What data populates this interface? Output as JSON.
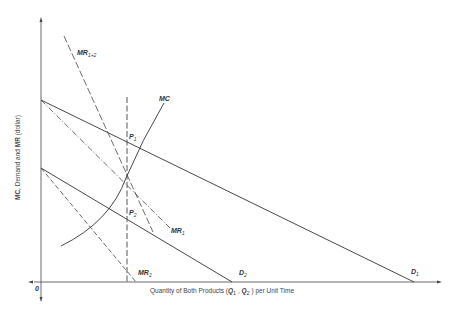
{
  "diagram": {
    "title": "",
    "axes": {
      "y_label_parts": {
        "mc": "MC",
        "mid": ", Demand and ",
        "mr": "MR",
        "end": " (dollar)"
      },
      "x_label_parts": {
        "pre": "Quantity of Both Products (",
        "q1": "Q",
        "q1sub": "1",
        "sep": " , ",
        "q2": "Q",
        "q2sub": "2",
        "post": " ) per Unit Time"
      },
      "origin": "0"
    },
    "curves": {
      "mr12": {
        "main": "MR",
        "sub": "1+2"
      },
      "mc": {
        "main": "MC"
      },
      "p1": {
        "main": "P",
        "sub": "1"
      },
      "p2": {
        "main": "P",
        "sub": "2"
      },
      "mr1": {
        "main": "MR",
        "sub": "1"
      },
      "mr2": {
        "main": "MR",
        "sub": "2"
      },
      "d1": {
        "main": "D",
        "sub": "1"
      },
      "d2": {
        "main": "D",
        "sub": "2"
      }
    },
    "colors": {
      "line": "#333333",
      "background": "#ffffff"
    }
  }
}
